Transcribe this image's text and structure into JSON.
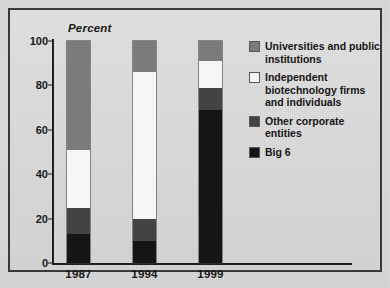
{
  "chart_data": {
    "type": "bar",
    "subtype": "stacked-bar-100",
    "title": "",
    "ylabel": "Percent",
    "xlabel": "",
    "categories": [
      "1987",
      "1994",
      "1999"
    ],
    "ylim": [
      0,
      100
    ],
    "yticks": [
      0,
      20,
      40,
      60,
      80,
      100
    ],
    "grid": false,
    "legend_position": "right",
    "series": [
      {
        "name": "Universities and public institutions",
        "color": "#7b7b7b",
        "values": [
          49,
          14,
          9
        ]
      },
      {
        "name": "Independent biotechnology firms and individuals",
        "color": "#ffffff",
        "values": [
          26,
          66,
          12
        ]
      },
      {
        "name": "Other corporate entities",
        "color": "#414141",
        "values": [
          12,
          10,
          10
        ]
      },
      {
        "name": "Big 6",
        "color": "#111111",
        "values": [
          13,
          10,
          69
        ]
      }
    ],
    "cumulative_tops": {
      "1987": {
        "big6": 13,
        "other": 25,
        "independent": 51,
        "universities": 100
      },
      "1994": {
        "big6": 10,
        "other": 20,
        "independent": 86,
        "universities": 100
      },
      "1999": {
        "big6": 69,
        "other": 79,
        "independent": 91,
        "universities": 100
      }
    }
  },
  "axis": {
    "y_title": "Percent",
    "y_ticks": [
      "100",
      "80",
      "60",
      "40",
      "20",
      "0"
    ],
    "x_ticks": [
      "1987",
      "1994",
      "1999"
    ]
  },
  "legend": {
    "items": [
      {
        "key": "universities",
        "label": "Universities and public institutions",
        "color": "#7b7b7b"
      },
      {
        "key": "independent",
        "label": "Independent biotechnology firms and individuals",
        "color": "#ffffff"
      },
      {
        "key": "other",
        "label": "Other corporate entities",
        "color": "#414141"
      },
      {
        "key": "big6",
        "label": "Big 6",
        "color": "#111111"
      }
    ]
  },
  "caption": ""
}
